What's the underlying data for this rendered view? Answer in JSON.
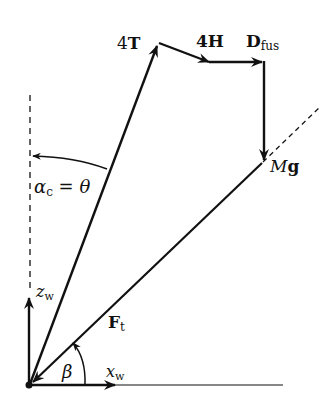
{
  "diagram": {
    "type": "force-vector-diagram",
    "labels": {
      "thrust": "4T",
      "hub_force": "4H",
      "drag_main": "D",
      "drag_sub": "fus",
      "weight_main": "M",
      "weight_vec": "g",
      "resultant_main": "F",
      "resultant_sub": "t",
      "angle_alpha": "α",
      "angle_alpha_sub": "c",
      "angle_eq": " = θ",
      "angle_beta": "β",
      "axis_z": "z",
      "axis_z_sub": "w",
      "axis_x": "x",
      "axis_x_sub": "w"
    },
    "colors": {
      "stroke": "#111111",
      "background": "#ffffff"
    }
  }
}
